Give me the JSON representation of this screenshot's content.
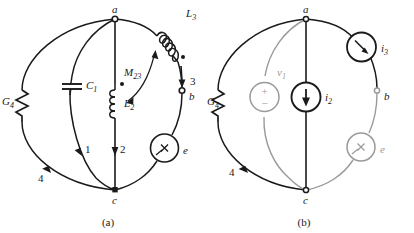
{
  "figure": {
    "kind": "circuit-graph-diagram",
    "panels": [
      {
        "id": "a",
        "caption": "(a)",
        "nodes": [
          {
            "name": "a",
            "label": "a",
            "position": "top"
          },
          {
            "name": "b",
            "label": "b",
            "position": "right"
          },
          {
            "name": "c",
            "label": "c",
            "position": "bottom"
          }
        ],
        "elements": [
          {
            "name": "conductance-g4",
            "label": "G_4",
            "label_text": "G",
            "sub": "4",
            "symbol": "resistor-zigzag",
            "branch": "4"
          },
          {
            "name": "capacitor-c1",
            "label": "C_1",
            "label_text": "C",
            "sub": "1",
            "symbol": "capacitor-plates",
            "branch": "1"
          },
          {
            "name": "inductor-l2",
            "label": "L_2",
            "label_text": "L",
            "sub": "2",
            "symbol": "inductor-coil",
            "branch": "2",
            "dot_marker": true
          },
          {
            "name": "inductor-l3",
            "label": "L_3",
            "label_text": "L",
            "sub": "3",
            "symbol": "inductor-coil",
            "branch": "3",
            "dot_marker": true
          },
          {
            "name": "mutual-inductance-m23",
            "label": "M_23",
            "label_text": "M",
            "sub": "23",
            "symbol": "coupling-arrow"
          },
          {
            "name": "element-e",
            "label": "e",
            "symbol": "circle-cross-source"
          }
        ],
        "branch_labels": [
          {
            "name": "branch-label-1",
            "text": "1",
            "direction": "down"
          },
          {
            "name": "branch-label-2",
            "text": "2",
            "direction": "down"
          },
          {
            "name": "branch-label-3",
            "text": "3",
            "direction": "down"
          },
          {
            "name": "branch-label-4",
            "text": "4",
            "direction": "down"
          }
        ]
      },
      {
        "id": "b",
        "caption": "(b)",
        "nodes": [
          {
            "name": "a",
            "label": "a",
            "position": "top"
          },
          {
            "name": "b",
            "label": "b",
            "position": "right"
          },
          {
            "name": "c",
            "label": "c",
            "position": "bottom"
          }
        ],
        "elements": [
          {
            "name": "conductance-g4",
            "label": "G_4",
            "label_text": "G",
            "sub": "4",
            "symbol": "resistor-zigzag",
            "branch": "4"
          },
          {
            "name": "voltage-source-v1",
            "label": "v_1",
            "label_text": "v",
            "sub": "1",
            "symbol": "circle-plus-minus-source",
            "polarity_top": "+",
            "polarity_bottom": "−"
          },
          {
            "name": "current-source-i2",
            "label": "i_2",
            "label_text": "i",
            "sub": "2",
            "symbol": "circle-arrow-source",
            "arrow_direction": "down"
          },
          {
            "name": "current-source-i3",
            "label": "i_3",
            "label_text": "i",
            "sub": "3",
            "symbol": "circle-arrow-source",
            "arrow_direction": "down-right"
          },
          {
            "name": "element-e",
            "label": "e",
            "symbol": "circle-cross-source"
          }
        ],
        "branch_labels": [
          {
            "name": "branch-label-4",
            "text": "4",
            "direction": "down"
          }
        ]
      }
    ],
    "colors": {
      "ink": "#1a1a1a",
      "muted_ink": "#9a9a9a",
      "background": "#ffffff"
    }
  }
}
